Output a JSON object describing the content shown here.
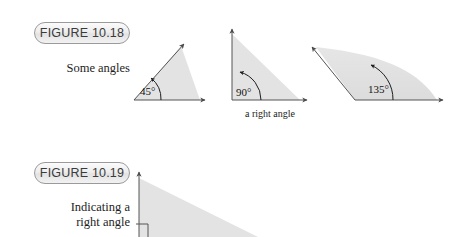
{
  "page": {
    "background": "#ffffff",
    "width": 465,
    "height": 237
  },
  "style": {
    "shade_fill": "#e3e3e3",
    "shade_fill_light": "#ececec",
    "stroke": "#555555",
    "text_color": "#1d1d1d",
    "pill_border": "#9a9a9a"
  },
  "figures": [
    {
      "id": "figure-10-18",
      "pill_label": "FIGURE 10.18",
      "caption": "Some angles",
      "caption_lines": [
        "Some angles"
      ],
      "diagrams": [
        {
          "id": "angle-45",
          "angle_label": "45°",
          "angle_value": 45,
          "sub_caption": ""
        },
        {
          "id": "angle-90",
          "angle_label": "90°",
          "angle_value": 90,
          "sub_caption": "a right angle"
        },
        {
          "id": "angle-135",
          "angle_label": "135°",
          "angle_value": 135,
          "sub_caption": ""
        }
      ]
    },
    {
      "id": "figure-10-19",
      "pill_label": "FIGURE 10.19",
      "caption": "Indicating a right angle",
      "caption_lines": [
        "Indicating a",
        "right angle"
      ],
      "diagrams": [
        {
          "id": "right-angle-marker",
          "angle_label": "",
          "angle_value": 90,
          "sub_caption": ""
        }
      ]
    }
  ]
}
